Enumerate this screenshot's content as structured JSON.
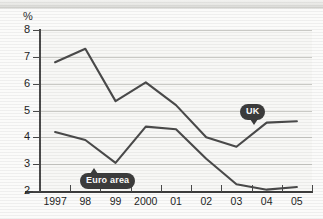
{
  "axis": {
    "unit_label": "%",
    "y_ticks": [
      "8",
      "7",
      "6",
      "5",
      "4",
      "3",
      "2"
    ],
    "x_ticks": [
      "1997",
      "98",
      "99",
      "2000",
      "01",
      "02",
      "03",
      "04",
      "05"
    ]
  },
  "annotations": {
    "uk_label": "UK",
    "euro_label": "Euro area"
  },
  "colors": {
    "line": "#4a4a4a",
    "badge": "#3c3c3c",
    "grid": "#c9c9c5",
    "plot_bg": "#f7f7f5"
  },
  "chart_data": {
    "type": "line",
    "title": "",
    "xlabel": "",
    "ylabel": "%",
    "ylim": [
      2,
      8
    ],
    "yticks": [
      2,
      3,
      4,
      5,
      6,
      7,
      8
    ],
    "grid": true,
    "legend": "inline-callouts",
    "categories": [
      "1997",
      "98",
      "99",
      "2000",
      "01",
      "02",
      "03",
      "04",
      "05"
    ],
    "series": [
      {
        "name": "UK",
        "values": [
          6.8,
          7.3,
          5.35,
          6.05,
          5.2,
          4.0,
          3.65,
          4.55,
          4.6
        ]
      },
      {
        "name": "Euro area",
        "values": [
          4.2,
          3.9,
          3.05,
          4.4,
          4.3,
          3.2,
          2.25,
          2.05,
          2.15
        ]
      }
    ]
  }
}
